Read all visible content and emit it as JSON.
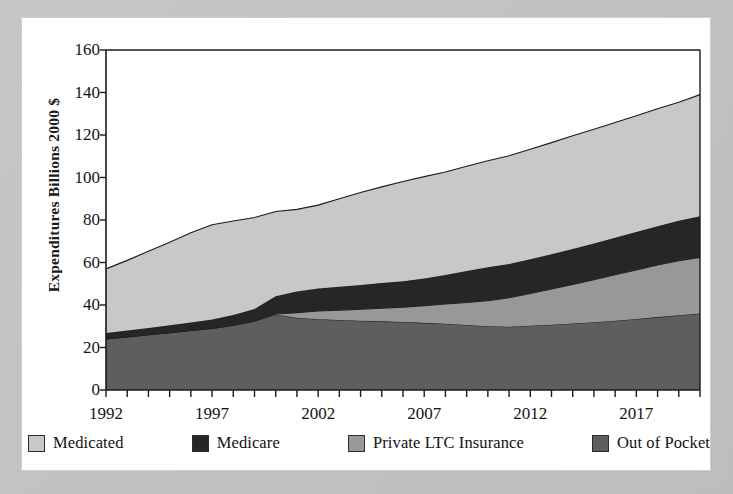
{
  "chart_data": {
    "type": "area",
    "stacked": true,
    "title": "",
    "subtitle": "",
    "xlabel": "",
    "ylabel": "Expenditures Billions 2000 $",
    "xlim": [
      1992,
      2020
    ],
    "ylim": [
      0,
      160
    ],
    "y_ticks": [
      0,
      20,
      40,
      60,
      80,
      100,
      120,
      140,
      160
    ],
    "x_ticks": [
      1992,
      1997,
      2002,
      2007,
      2012,
      2017
    ],
    "x_minor_tick_step": 1,
    "grid": false,
    "legend_position": "bottom",
    "x": [
      1992,
      1993,
      1994,
      1995,
      1996,
      1997,
      1998,
      1999,
      2000,
      2001,
      2002,
      2003,
      2004,
      2005,
      2006,
      2007,
      2008,
      2009,
      2010,
      2011,
      2012,
      2013,
      2014,
      2015,
      2016,
      2017,
      2018,
      2019,
      2020
    ],
    "series": [
      {
        "name": "Out of Pocket",
        "color": "#5e5e5e",
        "stack_order": 1,
        "values": [
          24.0,
          25.0,
          26.0,
          27.0,
          28.0,
          29.0,
          30.5,
          32.5,
          35.5,
          34.0,
          33.3,
          33.0,
          32.6,
          32.3,
          32.0,
          31.6,
          31.2,
          30.6,
          30.0,
          29.8,
          30.2,
          30.7,
          31.3,
          31.9,
          32.6,
          33.4,
          34.3,
          35.2,
          36.0
        ]
      },
      {
        "name": "Private LTC Insurance",
        "color": "#989898",
        "stack_order": 2,
        "values": [
          0.0,
          0.0,
          0.0,
          0.0,
          0.0,
          0.0,
          0.0,
          0.0,
          0.3,
          2.4,
          3.9,
          4.6,
          5.4,
          6.2,
          7.0,
          8.1,
          9.3,
          10.6,
          12.0,
          13.6,
          15.2,
          16.8,
          18.4,
          20.0,
          21.6,
          23.1,
          24.5,
          25.6,
          26.4
        ]
      },
      {
        "name": "Medicare",
        "color": "#262626",
        "stack_order": 3,
        "values": [
          2.8,
          3.0,
          3.2,
          3.5,
          3.8,
          4.2,
          4.8,
          5.6,
          8.3,
          10.0,
          10.6,
          11.0,
          11.4,
          11.8,
          12.2,
          12.8,
          13.6,
          14.8,
          15.8,
          15.9,
          16.1,
          16.4,
          16.7,
          17.0,
          17.4,
          17.8,
          18.3,
          18.8,
          19.4
        ]
      },
      {
        "name": "Medicated",
        "color": "#c8c8c8",
        "stack_order": 4,
        "values": [
          30.2,
          33.0,
          36.1,
          39.0,
          42.2,
          44.6,
          44.2,
          43.1,
          39.9,
          38.6,
          39.2,
          41.4,
          43.5,
          45.3,
          46.9,
          47.9,
          48.5,
          49.3,
          50.1,
          50.9,
          51.8,
          52.5,
          53.2,
          53.8,
          54.3,
          54.8,
          55.3,
          55.8,
          57.2
        ]
      }
    ],
    "stack_totals": [
      57.0,
      61.0,
      65.3,
      69.5,
      74.0,
      77.8,
      79.5,
      81.2,
      84.0,
      85.0,
      87.0,
      90.0,
      92.9,
      95.6,
      98.1,
      100.4,
      102.6,
      105.3,
      107.9,
      110.2,
      113.3,
      116.4,
      119.6,
      122.7,
      125.9,
      129.1,
      132.4,
      135.4,
      139.0
    ]
  },
  "axes": {
    "y_label": "Expenditures Billions 2000 $",
    "y_tick_labels": [
      "0",
      "20",
      "40",
      "60",
      "80",
      "100",
      "120",
      "140",
      "160"
    ],
    "x_tick_labels": [
      "1992",
      "1997",
      "2002",
      "2007",
      "2012",
      "2017"
    ]
  },
  "legend": {
    "items": [
      {
        "label": "Medicated",
        "color": "#c8c8c8"
      },
      {
        "label": "Medicare",
        "color": "#262626"
      },
      {
        "label": "Private LTC Insurance",
        "color": "#989898"
      },
      {
        "label": "Out of Pocket",
        "color": "#5e5e5e"
      }
    ]
  },
  "colors": {
    "page_background": "#ffffff",
    "frame": "#c2c2c2",
    "axis": "#1a1a1a",
    "text": "#141414"
  }
}
